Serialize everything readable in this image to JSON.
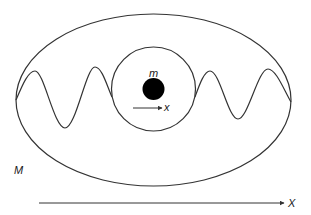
{
  "diagram": {
    "labels": {
      "small_mass": "m",
      "small_coordinate": "x",
      "large_mass": "M",
      "large_coordinate": "X"
    },
    "colors": {
      "stroke": "#333333",
      "mass_fill": "#000000",
      "background": "#ffffff"
    },
    "shapes": {
      "outer_ellipse": {
        "cx": 153.5,
        "cy": 100,
        "rx": 137.5,
        "ry": 86
      },
      "inner_circle": {
        "cx": 153.5,
        "cy": 89,
        "r": 42
      },
      "mass_dot": {
        "cx": 153.5,
        "cy": 89,
        "r": 11
      }
    }
  }
}
